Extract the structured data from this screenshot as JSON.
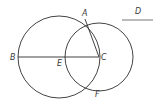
{
  "diagram": {
    "type": "geometric-construction",
    "points": [
      {
        "id": "A",
        "label": "A",
        "x": 85,
        "y": 19,
        "lx": 82,
        "ly": 16
      },
      {
        "id": "B",
        "label": "B",
        "x": 18,
        "y": 57,
        "lx": 10,
        "ly": 60
      },
      {
        "id": "C",
        "label": "C",
        "x": 99,
        "y": 57,
        "lx": 101,
        "ly": 60
      },
      {
        "id": "D",
        "label": "D",
        "x": 138,
        "y": 14,
        "lx": 135,
        "ly": 14
      },
      {
        "id": "E",
        "label": "E",
        "x": 59,
        "y": 57,
        "lx": 57,
        "ly": 66
      },
      {
        "id": "F",
        "label": "F",
        "x": 97,
        "y": 95,
        "lx": 95,
        "ly": 97
      }
    ],
    "circles": [
      {
        "name": "circle-centered-E",
        "cx": 59,
        "cy": 57,
        "r": 41
      },
      {
        "name": "circle-centered-C",
        "cx": 99,
        "cy": 57,
        "r": 34
      }
    ],
    "segments": [
      {
        "name": "segment-BC",
        "x1": 18,
        "y1": 57,
        "x2": 99,
        "y2": 57
      },
      {
        "name": "segment-AC",
        "x1": 85,
        "y1": 19,
        "x2": 99,
        "y2": 57
      },
      {
        "name": "segment-D",
        "x1": 122,
        "y1": 20,
        "x2": 153,
        "y2": 20
      }
    ],
    "colors": {
      "stroke": "#2e2e2e",
      "label": "#3a3a3a",
      "d_line": "#777777",
      "background": "#ffffff"
    }
  }
}
